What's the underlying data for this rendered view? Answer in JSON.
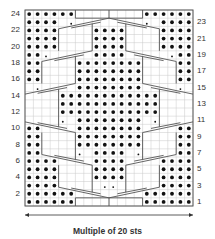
{
  "chart_title": "",
  "footer": {
    "label": "Multiple of 20 sts"
  },
  "rows_left": [
    "24",
    "22",
    "20",
    "18",
    "16",
    "14",
    "12",
    "10",
    "8",
    "6",
    "4",
    "2"
  ],
  "rows_right": [
    "23",
    "21",
    "19",
    "17",
    "15",
    "13",
    "11",
    "9",
    "7",
    "5",
    "3",
    "1"
  ],
  "colors": {
    "grid": "#c8c8c8",
    "border": "#555555",
    "dot": "#111111",
    "cable": "#555555"
  },
  "chart_data": {
    "type": "table",
    "columns": 20,
    "rows": 24,
    "legend": "Multiple of 20 sts",
    "purl_cells": {
      "24": [
        1,
        2,
        3,
        4,
        5,
        6,
        15,
        16,
        17,
        18,
        19,
        20
      ],
      "23": [
        1,
        2,
        3,
        4,
        17,
        18,
        19,
        20
      ],
      "22": [
        1,
        2,
        3,
        4,
        9,
        10,
        11,
        12,
        17,
        18,
        19,
        20
      ],
      "21": [
        1,
        2,
        3,
        4,
        9,
        10,
        11,
        12,
        17,
        18,
        19,
        20
      ],
      "20": [
        1,
        2,
        3,
        4,
        9,
        10,
        11,
        12,
        17,
        18,
        19,
        20
      ],
      "19": [
        1,
        2,
        9,
        10,
        11,
        12,
        19,
        20
      ],
      "18": [
        1,
        2,
        7,
        8,
        9,
        10,
        11,
        12,
        13,
        14,
        19,
        20
      ],
      "17": [
        1,
        2,
        7,
        8,
        9,
        10,
        11,
        12,
        13,
        14,
        19,
        20
      ],
      "16": [
        1,
        2,
        7,
        8,
        9,
        10,
        11,
        12,
        13,
        14,
        19,
        20
      ],
      "15": [
        7,
        8,
        9,
        10,
        11,
        12,
        13,
        14
      ],
      "14": [
        5,
        6,
        7,
        8,
        9,
        10,
        11,
        12,
        13,
        14,
        15,
        16
      ],
      "13": [
        5,
        6,
        7,
        8,
        9,
        10,
        11,
        12,
        13,
        14,
        15,
        16
      ],
      "12": [
        5,
        6,
        7,
        8,
        9,
        10,
        11,
        12,
        13,
        14,
        15,
        16
      ],
      "11": [
        7,
        8,
        9,
        10,
        11,
        12,
        13,
        14
      ],
      "10": [
        1,
        2,
        7,
        8,
        9,
        10,
        11,
        12,
        13,
        14,
        19,
        20
      ],
      "9": [
        1,
        2,
        7,
        8,
        9,
        10,
        11,
        12,
        13,
        14,
        19,
        20
      ],
      "8": [
        1,
        2,
        7,
        8,
        9,
        10,
        11,
        12,
        13,
        14,
        19,
        20
      ],
      "7": [
        1,
        2,
        9,
        10,
        11,
        12,
        19,
        20
      ],
      "6": [
        1,
        2,
        3,
        4,
        9,
        10,
        11,
        12,
        17,
        18,
        19,
        20
      ],
      "5": [
        1,
        2,
        3,
        4,
        9,
        10,
        11,
        12,
        17,
        18,
        19,
        20
      ],
      "4": [
        1,
        2,
        3,
        4,
        9,
        10,
        11,
        12,
        17,
        18,
        19,
        20
      ],
      "3": [
        1,
        2,
        3,
        4,
        17,
        18,
        19,
        20
      ],
      "2": [
        1,
        2,
        3,
        4,
        5,
        6,
        15,
        16,
        17,
        18,
        19,
        20
      ],
      "1": [
        1,
        2,
        3,
        4,
        5,
        6,
        15,
        16,
        17,
        18,
        19,
        20
      ]
    },
    "small_dot_cells": {
      "23": [
        6,
        15
      ],
      "19": [
        3,
        18
      ],
      "15": [
        2,
        19
      ],
      "11": [
        5,
        16
      ],
      "7": [
        7,
        14
      ],
      "3": [
        10,
        11
      ]
    }
  }
}
